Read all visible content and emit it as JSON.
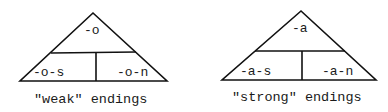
{
  "diagrams": [
    {
      "name": "weak",
      "top": "-o",
      "bottom_left": "-o-s",
      "bottom_right": "-o-n",
      "caption": "\"weak\" endings"
    },
    {
      "name": "strong",
      "top": "-a",
      "bottom_left": "-a-s",
      "bottom_right": "-a-n",
      "caption": "\"strong\" endings"
    }
  ]
}
